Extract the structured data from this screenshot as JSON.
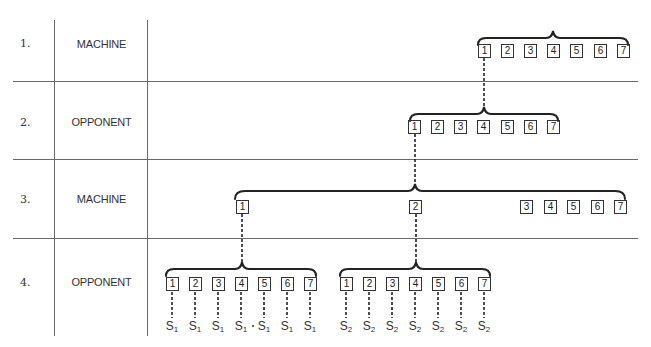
{
  "table": {
    "rows": [
      {
        "index": "1.",
        "role": "MACHINE"
      },
      {
        "index": "2.",
        "role": "OPPONENT"
      },
      {
        "index": "3.",
        "role": "MACHINE"
      },
      {
        "index": "4.",
        "role": "OPPONENT"
      }
    ]
  },
  "tree": {
    "level1": {
      "boxes": [
        "1",
        "2",
        "3",
        "4",
        "5",
        "6",
        "7"
      ]
    },
    "level2": {
      "boxes": [
        "1",
        "2",
        "3",
        "4",
        "5",
        "6",
        "7"
      ]
    },
    "level3": {
      "boxes": [
        "1",
        "2",
        "3",
        "4",
        "5",
        "6",
        "7"
      ]
    },
    "level4": {
      "group1": {
        "boxes": [
          "1",
          "2",
          "3",
          "4",
          "5",
          "6",
          "7"
        ],
        "leaf": "S",
        "leaf_sub": "1"
      },
      "group2": {
        "boxes": [
          "1",
          "2",
          "3",
          "4",
          "5",
          "6",
          "7"
        ],
        "leaf": "S",
        "leaf_sub": "2"
      }
    }
  }
}
